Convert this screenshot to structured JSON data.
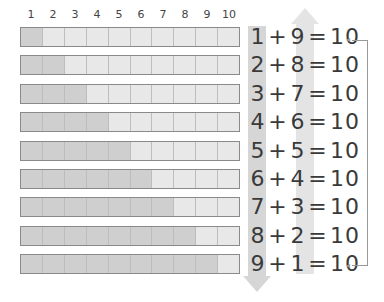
{
  "column_labels": [
    "1",
    "2",
    "3",
    "4",
    "5",
    "6",
    "7",
    "8",
    "9",
    "10"
  ],
  "rows": [
    {
      "a": "1",
      "op": "+",
      "b": "9",
      "eq": "=",
      "sum": "10",
      "dark": 1
    },
    {
      "a": "2",
      "op": "+",
      "b": "8",
      "eq": "=",
      "sum": "10",
      "dark": 2
    },
    {
      "a": "3",
      "op": "+",
      "b": "7",
      "eq": "=",
      "sum": "10",
      "dark": 3
    },
    {
      "a": "4",
      "op": "+",
      "b": "6",
      "eq": "=",
      "sum": "10",
      "dark": 4
    },
    {
      "a": "5",
      "op": "+",
      "b": "5",
      "eq": "=",
      "sum": "10",
      "dark": 5
    },
    {
      "a": "6",
      "op": "+",
      "b": "4",
      "eq": "=",
      "sum": "10",
      "dark": 6
    },
    {
      "a": "7",
      "op": "+",
      "b": "3",
      "eq": "=",
      "sum": "10",
      "dark": 7
    },
    {
      "a": "8",
      "op": "+",
      "b": "2",
      "eq": "=",
      "sum": "10",
      "dark": 8
    },
    {
      "a": "9",
      "op": "+",
      "b": "1",
      "eq": "=",
      "sum": "10",
      "dark": 9
    }
  ],
  "colors": {
    "dark_cell": "#cfcfcf",
    "light_cell": "#e8e8e8",
    "border": "#8a8a8a",
    "text": "#3a3a3a"
  },
  "arrow_tip_glyph": "◂"
}
